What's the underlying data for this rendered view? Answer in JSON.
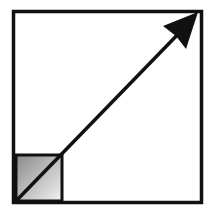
{
  "diagram": {
    "icon": "scale-up-arrow-icon",
    "colors": {
      "stroke": "#111111",
      "background": "#ffffff",
      "gradient_light": "#f4f4f4",
      "gradient_dark": "#8a8a8a"
    }
  }
}
